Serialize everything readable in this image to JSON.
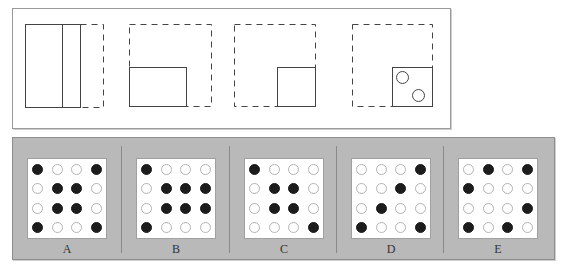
{
  "top_panel": {
    "figures": [
      {
        "id": "fold-1",
        "label": "Fold 1"
      },
      {
        "id": "fold-2",
        "label": "Fold 2"
      },
      {
        "id": "fold-3",
        "label": "Fold 3"
      },
      {
        "id": "hole-punch",
        "label": "Hole Punch"
      }
    ]
  },
  "options": [
    {
      "label": "A",
      "grid": [
        [
          1,
          0,
          0,
          1
        ],
        [
          0,
          1,
          1,
          0
        ],
        [
          0,
          1,
          1,
          0
        ],
        [
          1,
          0,
          0,
          1
        ]
      ]
    },
    {
      "label": "B",
      "grid": [
        [
          1,
          0,
          0,
          0
        ],
        [
          0,
          1,
          1,
          1
        ],
        [
          0,
          1,
          1,
          1
        ],
        [
          1,
          0,
          0,
          0
        ]
      ]
    },
    {
      "label": "C",
      "grid": [
        [
          1,
          0,
          0,
          0
        ],
        [
          0,
          1,
          1,
          0
        ],
        [
          0,
          1,
          1,
          0
        ],
        [
          0,
          0,
          0,
          1
        ]
      ]
    },
    {
      "label": "D",
      "grid": [
        [
          0,
          0,
          0,
          1
        ],
        [
          0,
          0,
          1,
          0
        ],
        [
          0,
          1,
          0,
          0
        ],
        [
          1,
          0,
          0,
          1
        ]
      ]
    },
    {
      "label": "E",
      "grid": [
        [
          0,
          1,
          0,
          1
        ],
        [
          1,
          0,
          0,
          0
        ],
        [
          0,
          0,
          0,
          1
        ],
        [
          1,
          0,
          1,
          0
        ]
      ]
    }
  ],
  "colors": {
    "panel_bg": "#b9b9b9",
    "filled_hole": "#1c1c1c",
    "empty_hole_border": "#b3b3b3"
  }
}
